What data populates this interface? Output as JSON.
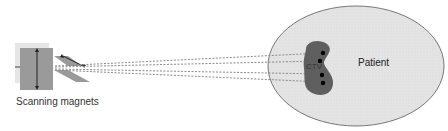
{
  "diagram": {
    "magnets_label": "Scanning magnets",
    "patient_label": "Patient",
    "target_label": "CTV",
    "colors": {
      "patient_fill": "#e3e3e3",
      "target_fill": "#5f5f5f",
      "magnet_fill": "#9a9a9a",
      "beam_line": "#8a8a8a"
    }
  }
}
